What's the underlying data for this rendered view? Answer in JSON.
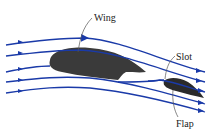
{
  "diagram": {
    "labels": {
      "wing": "Wing",
      "slot": "Slot",
      "flap": "Flap"
    },
    "colors": {
      "streamline": "#1a3aa8",
      "airfoil": "#3a3a3a",
      "leader": "#555555",
      "background": "#ffffff"
    },
    "streamline_count": 5
  }
}
